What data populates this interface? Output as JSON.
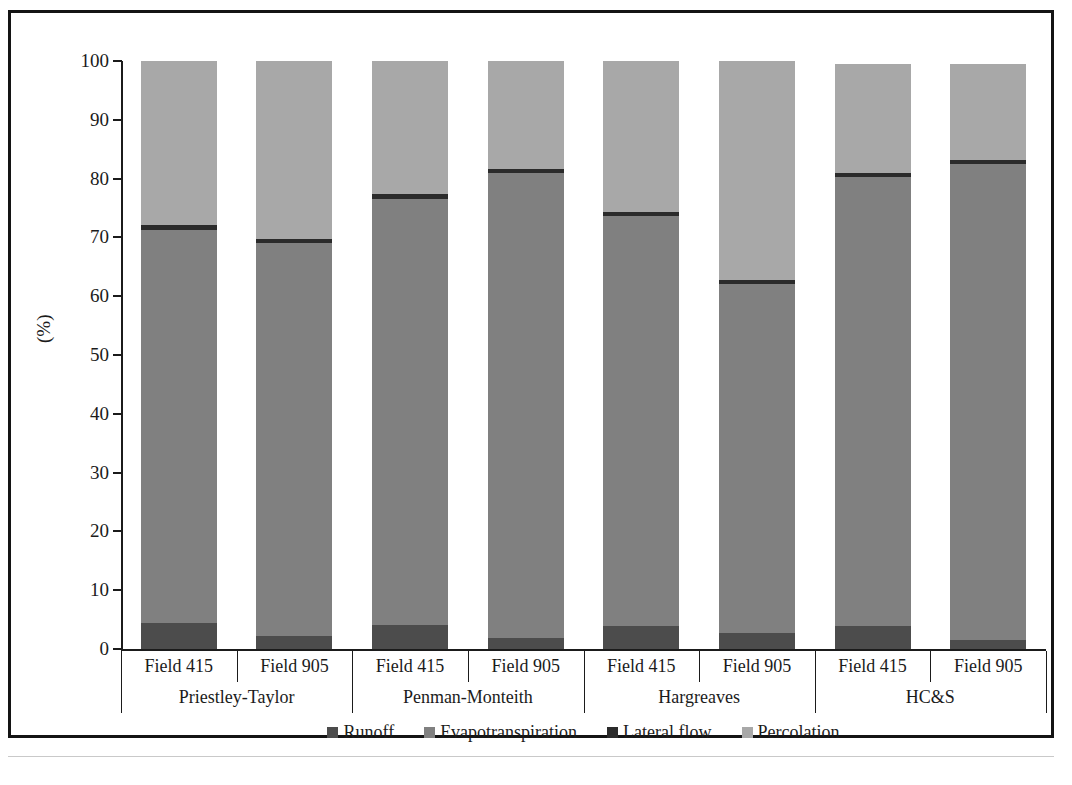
{
  "chart_data": {
    "type": "bar",
    "subtype": "stacked-bar-100",
    "title": "",
    "xlabel": "",
    "ylabel": "(%)",
    "ylim": [
      0,
      100
    ],
    "yticks": [
      0,
      10,
      20,
      30,
      40,
      50,
      60,
      70,
      80,
      90,
      100
    ],
    "ytick_labels": [
      "0",
      "10",
      "20",
      "30",
      "40",
      "50",
      "60",
      "70",
      "80",
      "90",
      "100"
    ],
    "grid": false,
    "legend_position": "bottom-center",
    "legend": [
      "Runoff",
      "Evapotranspiration",
      "Lateral flow",
      "Percolation"
    ],
    "group_labels": [
      "Priestley-Taylor",
      "Penman-Monteith",
      "Hargreaves",
      "HC&S"
    ],
    "categories": [
      "Field 415",
      "Field 905",
      "Field 415",
      "Field 905",
      "Field 415",
      "Field 905",
      "Field 415",
      "Field 905"
    ],
    "series": [
      {
        "name": "Runoff",
        "color": "#4c4c4c",
        "values": [
          4.5,
          2.2,
          4.1,
          1.9,
          3.9,
          2.7,
          3.9,
          1.5
        ]
      },
      {
        "name": "Evapotranspiration",
        "color": "#808080",
        "values": [
          66.8,
          66.8,
          72.4,
          79.1,
          69.7,
          59.4,
          76.3,
          80.9
        ]
      },
      {
        "name": "Lateral flow",
        "color": "#2b2b2b",
        "values": [
          0.8,
          0.8,
          0.8,
          0.7,
          0.7,
          0.7,
          0.7,
          0.7
        ]
      },
      {
        "name": "Percolation",
        "color": "#a8a8a8",
        "values": [
          27.9,
          30.2,
          22.7,
          18.3,
          25.7,
          37.2,
          18.6,
          16.4
        ]
      }
    ],
    "bar_totals": [
      100.0,
      100.0,
      100.0,
      100.0,
      100.0,
      100.0,
      99.5,
      99.5
    ]
  },
  "colors": {
    "runoff": "#4c4c4c",
    "evapotranspiration": "#808080",
    "lateral_flow": "#2b2b2b",
    "percolation": "#a8a8a8",
    "axis": "#1b1b1b",
    "frame": "#141414",
    "background": "#ffffff"
  }
}
